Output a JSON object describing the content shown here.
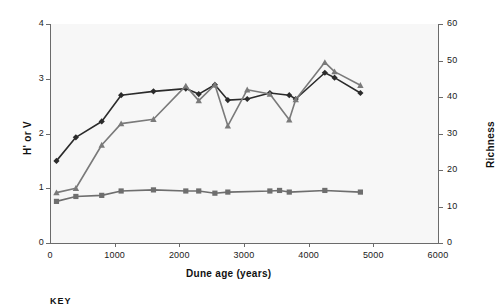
{
  "chart_data": {
    "type": "line",
    "title": "",
    "xlabel": "Dune age (years)",
    "ylabel": "H' or V",
    "y2label": "Richness",
    "xlim": [
      0,
      6000
    ],
    "ylim": [
      0,
      4
    ],
    "y2lim": [
      0,
      60
    ],
    "xticks": [
      "0",
      "1000",
      "2000",
      "3000",
      "4000",
      "5000",
      "6000"
    ],
    "xtick_values": [
      0,
      1000,
      2000,
      3000,
      4000,
      5000,
      6000
    ],
    "yticks": [
      "0",
      "1",
      "2",
      "3",
      "4"
    ],
    "ytick_values": [
      0,
      1,
      2,
      3,
      4
    ],
    "y2ticks": [
      "0",
      "10",
      "20",
      "30",
      "40",
      "50",
      "60"
    ],
    "y2tick_values": [
      0,
      10,
      20,
      30,
      40,
      50,
      60
    ],
    "grid": false,
    "legend_position": "below-plot",
    "legend_title": "KEY",
    "series": [
      {
        "name": "richness-diamond-series",
        "marker": "diamond",
        "color": "#2b2b2b",
        "axis": "right",
        "x": [
          100,
          400,
          800,
          1100,
          1600,
          2100,
          2300,
          2550,
          2750,
          3050,
          3400,
          3700,
          3800,
          4250,
          4400,
          4800
        ],
        "y": [
          1.5,
          1.93,
          2.22,
          2.7,
          2.77,
          2.82,
          2.72,
          2.89,
          2.61,
          2.63,
          2.74,
          2.7,
          2.63,
          3.11,
          3.02,
          2.74
        ]
      },
      {
        "name": "diversity-triangle-series",
        "marker": "triangle",
        "color": "#7a7a7a",
        "axis": "left",
        "x": [
          100,
          400,
          800,
          1100,
          1600,
          2100,
          2300,
          2550,
          2750,
          3050,
          3400,
          3700,
          3800,
          4250,
          4400,
          4800
        ],
        "y": [
          0.92,
          1.0,
          1.79,
          2.18,
          2.26,
          2.87,
          2.6,
          2.89,
          2.14,
          2.8,
          2.72,
          2.25,
          2.62,
          3.3,
          3.13,
          2.88
        ]
      },
      {
        "name": "evenness-square-series",
        "marker": "square",
        "color": "#6e6e6e",
        "axis": "left",
        "x": [
          100,
          400,
          800,
          1100,
          1600,
          2100,
          2300,
          2550,
          2750,
          3400,
          3550,
          3700,
          4250,
          4800
        ],
        "y": [
          0.76,
          0.85,
          0.87,
          0.95,
          0.97,
          0.95,
          0.95,
          0.91,
          0.93,
          0.95,
          0.96,
          0.93,
          0.96,
          0.93
        ]
      }
    ]
  }
}
